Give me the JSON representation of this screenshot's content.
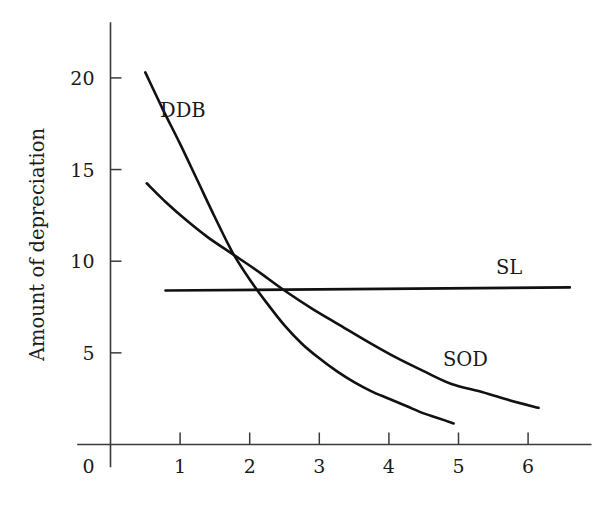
{
  "chart_data": {
    "type": "line",
    "title": "",
    "subtitle": "",
    "xlabel": "",
    "ylabel": "Amount of depreciation",
    "xlim": [
      0,
      6.9
    ],
    "ylim": [
      0,
      23
    ],
    "grid": false,
    "legend_position": "inline-annotations",
    "x_ticks": [
      "1",
      "2",
      "3",
      "4",
      "5",
      "6"
    ],
    "x_tick_values": [
      1,
      2,
      3,
      4,
      5,
      6
    ],
    "y_ticks": [
      "5",
      "10",
      "15",
      "20"
    ],
    "y_tick_values": [
      5,
      10,
      15,
      20
    ],
    "origin_label": "0",
    "annotations": [
      {
        "text": "DDB",
        "x": 1.0,
        "y": 18.7
      },
      {
        "text": "SL",
        "x": 5.7,
        "y": 10.1
      },
      {
        "text": "SOD",
        "x": 4.95,
        "y": 5.1
      }
    ],
    "series": [
      {
        "name": "DDB",
        "label": "DDB",
        "description": "Double declining balance depreciation",
        "points": [
          {
            "x": 0.5,
            "y": 20.3
          },
          {
            "x": 0.75,
            "y": 18.3
          },
          {
            "x": 1.0,
            "y": 16.4
          },
          {
            "x": 1.25,
            "y": 14.4
          },
          {
            "x": 1.5,
            "y": 12.4
          },
          {
            "x": 1.75,
            "y": 10.5
          },
          {
            "x": 2.0,
            "y": 9.0
          },
          {
            "x": 2.25,
            "y": 7.7
          },
          {
            "x": 2.5,
            "y": 6.5
          },
          {
            "x": 2.75,
            "y": 5.5
          },
          {
            "x": 3.0,
            "y": 4.7
          },
          {
            "x": 3.25,
            "y": 4.0
          },
          {
            "x": 3.5,
            "y": 3.4
          },
          {
            "x": 3.75,
            "y": 2.9
          },
          {
            "x": 4.0,
            "y": 2.5
          },
          {
            "x": 4.25,
            "y": 2.1
          },
          {
            "x": 4.5,
            "y": 1.7
          },
          {
            "x": 4.7,
            "y": 1.45
          },
          {
            "x": 4.93,
            "y": 1.15
          }
        ]
      },
      {
        "name": "SOD",
        "label": "SOD",
        "description": "Sum of digits depreciation",
        "points": [
          {
            "x": 0.52,
            "y": 14.25
          },
          {
            "x": 0.8,
            "y": 13.2
          },
          {
            "x": 1.1,
            "y": 12.2
          },
          {
            "x": 1.4,
            "y": 11.3
          },
          {
            "x": 1.75,
            "y": 10.4
          },
          {
            "x": 2.1,
            "y": 9.5
          },
          {
            "x": 2.5,
            "y": 8.4
          },
          {
            "x": 2.9,
            "y": 7.4
          },
          {
            "x": 3.3,
            "y": 6.5
          },
          {
            "x": 3.7,
            "y": 5.6
          },
          {
            "x": 4.1,
            "y": 4.75
          },
          {
            "x": 4.5,
            "y": 4.0
          },
          {
            "x": 4.9,
            "y": 3.3
          },
          {
            "x": 5.3,
            "y": 2.9
          },
          {
            "x": 5.7,
            "y": 2.45
          },
          {
            "x": 6.15,
            "y": 2.0
          }
        ]
      },
      {
        "name": "SL",
        "label": "SL",
        "description": "Straight line depreciation",
        "points": [
          {
            "x": 0.79,
            "y": 8.4
          },
          {
            "x": 6.6,
            "y": 8.57
          }
        ]
      }
    ]
  }
}
